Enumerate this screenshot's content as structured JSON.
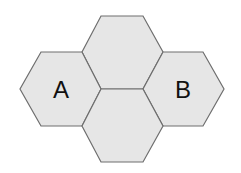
{
  "diagram": {
    "type": "hexagon-tiling",
    "fill_color": "#e6e6e6",
    "stroke_color": "#6e6e6e",
    "hexagons": [
      {
        "id": "left",
        "label": "A"
      },
      {
        "id": "top",
        "label": ""
      },
      {
        "id": "bottom",
        "label": ""
      },
      {
        "id": "right",
        "label": "B"
      }
    ]
  }
}
